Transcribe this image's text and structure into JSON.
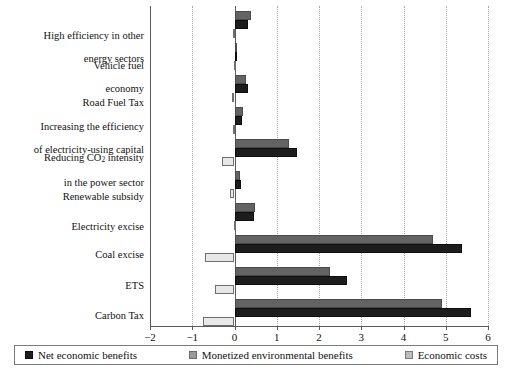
{
  "chart_data": {
    "type": "bar",
    "orientation": "horizontal",
    "title": "",
    "subtitle": "",
    "xlabel": "",
    "ylabel": "",
    "xlim": [
      -2,
      6
    ],
    "xticks": [
      "-2",
      "-1",
      "0",
      "1",
      "2",
      "3",
      "4",
      "5",
      "6"
    ],
    "xtick_values": [
      -2,
      -1,
      0,
      1,
      2,
      3,
      4,
      5,
      6
    ],
    "grid": "vertical-dotted",
    "legend_position": "bottom",
    "categories": [
      "High efficiency in other\nenergy sectors",
      "Vehicle fuel\neconomy",
      "Road Fuel Tax",
      "Increasing the efficiency\nof electricity-using capital",
      "Reducing CO2 intensity\nin the power sector",
      "Renewable subsidy",
      "Electricity excise",
      "Coal excise",
      "ETS",
      "Carbon Tax"
    ],
    "series": [
      {
        "name": "Net economic benefits",
        "color": "#1d1d1d",
        "values": [
          0.33,
          0.02,
          0.32,
          0.18,
          1.48,
          0.15,
          0.45,
          5.38,
          2.66,
          5.6
        ]
      },
      {
        "name": "Monetized environmental benefits",
        "color": "#636363",
        "values": [
          0.38,
          0.02,
          0.28,
          0.2,
          1.29,
          0.12,
          0.48,
          4.71,
          2.27,
          4.9
        ]
      },
      {
        "name": "Economic costs",
        "color": "#e8e8e8",
        "values": [
          -0.03,
          -0.01,
          -0.05,
          -0.04,
          -0.3,
          -0.1,
          -0.01,
          -0.69,
          -0.45,
          -0.74
        ]
      }
    ]
  },
  "legend": {
    "items": [
      {
        "label": "Net economic benefits",
        "swatch": "net-swatch"
      },
      {
        "label": "Monetized environmental benefits",
        "swatch": "env-swatch"
      },
      {
        "label": "Economic costs",
        "swatch": "cost-swatch"
      }
    ]
  },
  "labels": {
    "cat_0_line1": "High efficiency in other",
    "cat_0_line2": "energy sectors",
    "cat_1_line1": "Vehicle fuel",
    "cat_1_line2": "economy",
    "cat_2": "Road Fuel Tax",
    "cat_3_line1": "Increasing the efficiency",
    "cat_3_line2": "of electricity-using capital",
    "cat_4_line1_a": "Reducing CO",
    "cat_4_line1_sub": "2",
    "cat_4_line1_b": " intensity",
    "cat_4_line2": "in the power sector",
    "cat_5": "Renewable subsidy",
    "cat_6": "Electricity excise",
    "cat_7": "Coal excise",
    "cat_8": "ETS",
    "cat_9": "Carbon Tax"
  }
}
